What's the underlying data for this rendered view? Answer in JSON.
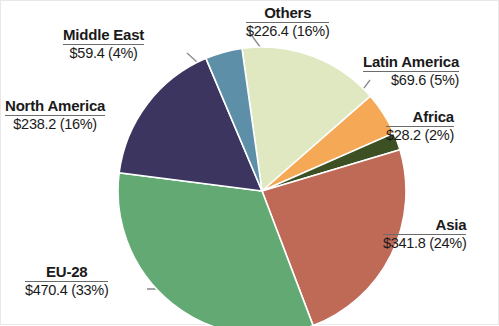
{
  "chart_data": {
    "type": "pie",
    "title": "",
    "subtitle": "",
    "xlabel": "",
    "ylabel": "",
    "legend_position": "none",
    "grid": false,
    "units": "billion USD",
    "total_value": 1434.0,
    "total_percent": 100,
    "categories": [
      "Others",
      "Latin America",
      "Africa",
      "Asia",
      "EU-28",
      "North America",
      "Middle East"
    ],
    "values": [
      226.4,
      69.6,
      28.2,
      341.8,
      470.4,
      238.2,
      59.4
    ],
    "percents": [
      16,
      5,
      2,
      24,
      33,
      16,
      4
    ],
    "colors": [
      "#dfe8c0",
      "#f5a855",
      "#3d5023",
      "#bf6a56",
      "#63a973",
      "#3b3560",
      "#5d8fa8"
    ],
    "start_angle_deg": -8,
    "direction": "clockwise",
    "slices": [
      {
        "id": "others",
        "name": "Others",
        "value_label": "$226.4 (16%)",
        "value": 226.4,
        "percent": 16,
        "color": "#dfe8c0",
        "label_position": "top-center"
      },
      {
        "id": "latin-america",
        "name": "Latin America",
        "value_label": "$69.6 (5%)",
        "value": 69.6,
        "percent": 5,
        "color": "#f5a855",
        "label_position": "top-right"
      },
      {
        "id": "africa",
        "name": "Africa",
        "value_label": "$28.2 (2%)",
        "value": 28.2,
        "percent": 2,
        "color": "#3d5023",
        "label_position": "right"
      },
      {
        "id": "asia",
        "name": "Asia",
        "value_label": "$341.8 (24%)",
        "value": 341.8,
        "percent": 24,
        "color": "#bf6a56",
        "label_position": "bottom-right"
      },
      {
        "id": "eu-28",
        "name": "EU-28",
        "value_label": "$470.4 (33%)",
        "value": 470.4,
        "percent": 33,
        "color": "#63a973",
        "label_position": "bottom-left"
      },
      {
        "id": "north-america",
        "name": "North America",
        "value_label": "$238.2 (16%)",
        "value": 238.2,
        "percent": 16,
        "color": "#3b3560",
        "label_position": "left"
      },
      {
        "id": "middle-east",
        "name": "Middle East",
        "value_label": "$59.4 (4%)",
        "value": 59.4,
        "percent": 4,
        "color": "#5d8fa8",
        "label_position": "top-left"
      }
    ]
  },
  "labels": {
    "others": {
      "name": "Others",
      "value": "$226.4 (16%)"
    },
    "latin_america": {
      "name": "Latin America",
      "value": "$69.6 (5%)"
    },
    "africa": {
      "name": "Africa",
      "value": "$28.2 (2%)"
    },
    "asia": {
      "name": "Asia",
      "value": "$341.8 (24%)"
    },
    "eu_28": {
      "name": "EU-28",
      "value": "$470.4 (33%)"
    },
    "north_america": {
      "name": "North America",
      "value": "$238.2 (16%)"
    },
    "middle_east": {
      "name": "Middle East",
      "value": "$59.4 (4%)"
    }
  }
}
